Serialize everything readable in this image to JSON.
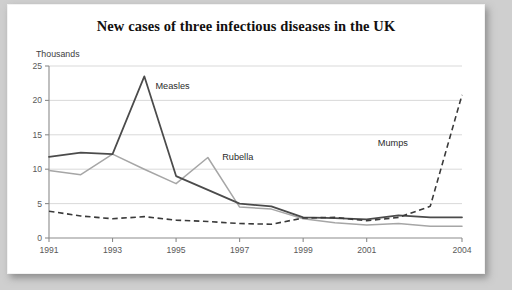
{
  "card": {
    "title": "New cases of three infectious diseases in the UK"
  },
  "chart_data": {
    "type": "line",
    "title": "New cases of three infectious diseases in the UK",
    "xlabel": "",
    "ylabel": "Thousands",
    "y_unit_label": "Thousands",
    "xlim": [
      1991,
      2004
    ],
    "ylim": [
      0,
      25
    ],
    "y_ticks": [
      0,
      5,
      10,
      15,
      20,
      25
    ],
    "y_tick_labels": [
      "0",
      "5",
      "10",
      "15",
      "20",
      "25"
    ],
    "x_ticks": [
      1991,
      1993,
      1995,
      1997,
      1999,
      2001,
      2004
    ],
    "x_tick_labels": [
      "1991",
      "1993",
      "1995",
      "1997",
      "1999",
      "2001",
      "2004"
    ],
    "x": [
      1991,
      1992,
      1993,
      1994,
      1995,
      1996,
      1997,
      1998,
      1999,
      2000,
      2001,
      2002,
      2003,
      2004
    ],
    "grid": "horizontal",
    "legend_position": "inline-annotations",
    "series": [
      {
        "name": "Measles",
        "style": "solid",
        "color": "#4b4b4b",
        "values": [
          11.8,
          12.4,
          12.2,
          23.5,
          9.0,
          7.0,
          5.0,
          4.6,
          3.0,
          2.9,
          2.7,
          3.3,
          3.0,
          3.0
        ]
      },
      {
        "name": "Rubella",
        "style": "solid",
        "color": "#a6a6a6",
        "values": [
          9.8,
          9.2,
          12.2,
          10.0,
          7.9,
          11.7,
          4.5,
          4.2,
          2.8,
          2.2,
          1.9,
          2.1,
          1.7,
          1.7
        ]
      },
      {
        "name": "Mumps",
        "style": "dashed",
        "color": "#3a3a3a",
        "values": [
          3.9,
          3.2,
          2.8,
          3.1,
          2.6,
          2.4,
          2.1,
          2.0,
          2.9,
          3.0,
          2.5,
          3.0,
          4.6,
          20.8
        ]
      }
    ],
    "annotations": [
      {
        "text": "Measles",
        "x": 1994.35,
        "y": 21.6
      },
      {
        "text": "Rubella",
        "x": 1996.45,
        "y": 11.3
      },
      {
        "text": "Mumps",
        "x": 2001.35,
        "y": 13.3
      }
    ]
  }
}
